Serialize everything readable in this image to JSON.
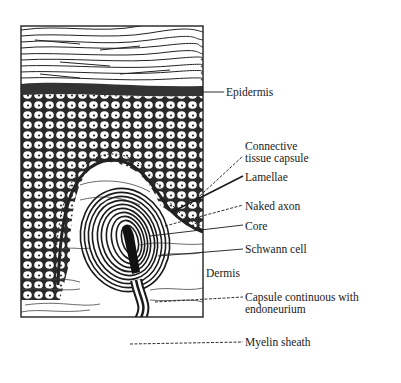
{
  "figure": {
    "labels": {
      "epidermis": "Epidermis",
      "connective_line1": "Connective",
      "connective_line2": "tissue capsule",
      "lamellae": "Lamellae",
      "naked_axon": "Naked axon",
      "core": "Core",
      "schwann_cell": "Schwann cell",
      "dermis": "Dermis",
      "capsule_line1": "Capsule continuous with",
      "capsule_line2": "endoneurium",
      "myelin_sheath": "Myelin sheath"
    },
    "colors": {
      "ink": "#1a1a1a",
      "background": "#ffffff"
    }
  }
}
